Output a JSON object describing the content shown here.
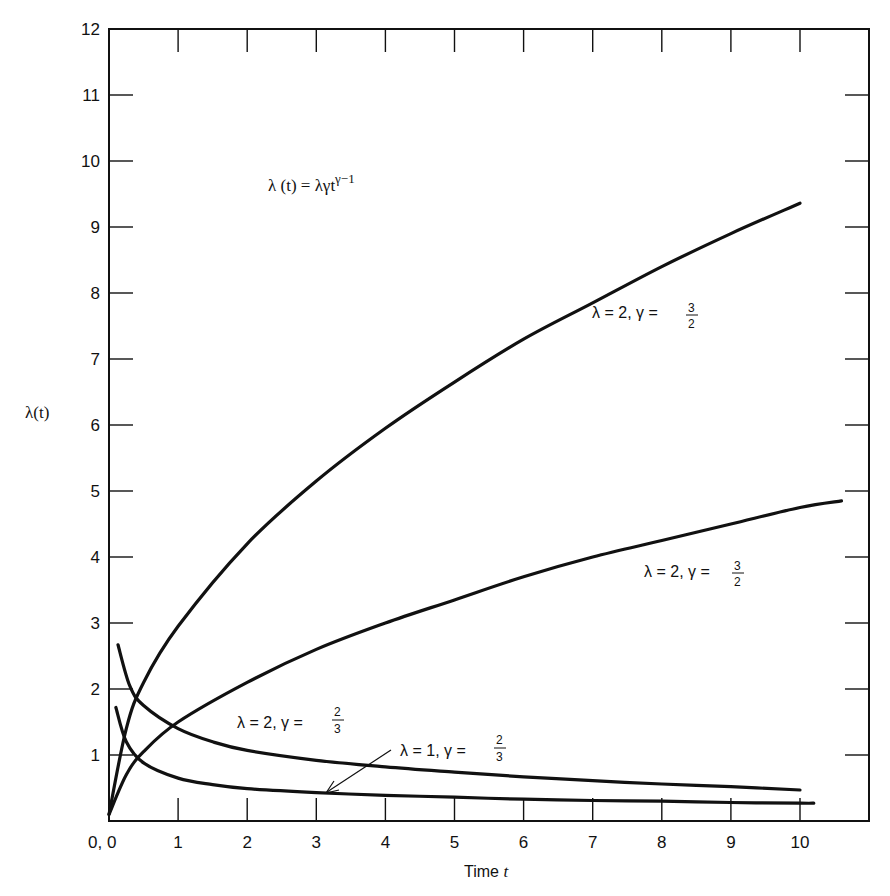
{
  "chart_data": {
    "type": "line",
    "title": "",
    "formula": "λ(t) = λγt^(γ−1)",
    "formula_parts": {
      "lhs": "λ (t) = λγt",
      "exp": "γ−1"
    },
    "xlabel": "Time t",
    "xlabel_parts": {
      "text": "Time ",
      "var": "t"
    },
    "ylabel": "λ(t)",
    "xlim": [
      0,
      11
    ],
    "ylim": [
      0,
      12
    ],
    "grid": false,
    "origin_label": "0, 0",
    "x_ticks": [
      "1",
      "2",
      "3",
      "4",
      "5",
      "6",
      "7",
      "8",
      "9",
      "10"
    ],
    "y_ticks": [
      "1",
      "2",
      "3",
      "4",
      "5",
      "6",
      "7",
      "8",
      "9",
      "10",
      "11",
      "12"
    ],
    "series": [
      {
        "name": "λ = 2, γ = 3/2 (upper)",
        "label": {
          "text": "λ = 2, γ = ",
          "num": "3",
          "den": "2"
        },
        "x": [
          0,
          0.25,
          0.5,
          1,
          2,
          3,
          4,
          5,
          6,
          7,
          8,
          9,
          10
        ],
        "values": [
          0.1,
          1.4,
          2.1,
          2.95,
          4.2,
          5.15,
          5.95,
          6.65,
          7.3,
          7.85,
          8.4,
          8.9,
          9.36
        ]
      },
      {
        "name": "λ = 2, γ = 3/2 (lower)",
        "label": {
          "text": "λ = 2, γ = ",
          "num": "3",
          "den": "2"
        },
        "x": [
          0,
          0.25,
          0.5,
          1,
          2,
          3,
          4,
          5,
          6,
          7,
          8,
          9,
          10,
          10.6
        ],
        "values": [
          0.1,
          0.7,
          1.05,
          1.5,
          2.1,
          2.6,
          3.0,
          3.35,
          3.7,
          4.0,
          4.25,
          4.5,
          4.75,
          4.85
        ]
      },
      {
        "name": "λ = 2, γ = 2/3",
        "label": {
          "text": "λ = 2, γ = ",
          "num": "2",
          "den": "3"
        },
        "x": [
          0.13,
          0.3,
          0.5,
          1,
          1.5,
          2,
          3,
          4,
          5,
          6,
          7,
          8,
          9,
          10
        ],
        "values": [
          2.67,
          2.05,
          1.75,
          1.4,
          1.2,
          1.07,
          0.92,
          0.82,
          0.74,
          0.67,
          0.61,
          0.56,
          0.52,
          0.47
        ]
      },
      {
        "name": "λ = 1, γ = 2/3",
        "label": {
          "text": "λ = 1, γ = ",
          "num": "2",
          "den": "3"
        },
        "x": [
          0.1,
          0.25,
          0.5,
          1,
          1.5,
          2,
          3,
          4,
          5,
          6,
          7,
          8,
          9,
          10,
          10.2
        ],
        "values": [
          1.72,
          1.2,
          0.88,
          0.65,
          0.55,
          0.49,
          0.43,
          0.39,
          0.36,
          0.33,
          0.31,
          0.3,
          0.28,
          0.27,
          0.27
        ]
      }
    ],
    "annotations": [
      {
        "text": "λ(t) = λγt^(γ−1)",
        "x": 1.3,
        "y": 10.1
      },
      {
        "text": "λ = 2, γ = 3/2",
        "x": 7.2,
        "y": 7.5
      },
      {
        "text": "λ = 2, γ = 3/2",
        "x": 6.8,
        "y": 3.45
      },
      {
        "text": "λ = 2, γ = 2/3",
        "x": 0.8,
        "y": 1.3
      },
      {
        "text": "λ = 1, γ = 2/3 (arrow to lower curve at t≈3)",
        "x": 3.3,
        "y": 0.95
      }
    ]
  }
}
